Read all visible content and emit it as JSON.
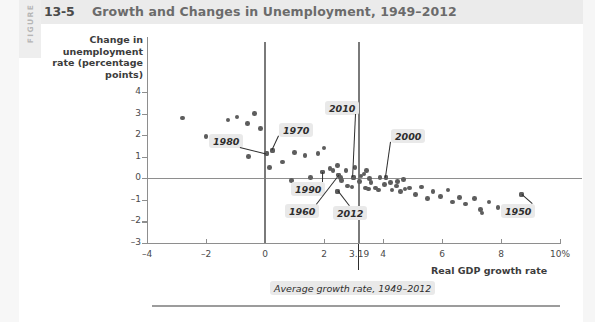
{
  "figure": {
    "kicker": "FIGURE",
    "number": "13-5",
    "title": "Growth and Changes in Unemployment, 1949–2012"
  },
  "chart_data": {
    "type": "scatter",
    "title": "Growth and Changes in Unemployment, 1949–2012",
    "xlabel": "Real GDP growth rate",
    "ylabel": "Change in unemployment rate (percentage points)",
    "xlim": [
      -4,
      10
    ],
    "ylim": [
      -3,
      4
    ],
    "xticks": [
      "-4",
      "-2",
      "0",
      "2",
      "3.19",
      "4",
      "6",
      "8",
      "10%"
    ],
    "xtick_values": [
      -4,
      -2,
      0,
      2,
      3.19,
      4,
      6,
      8,
      10
    ],
    "yticks": [
      "4",
      "3",
      "2",
      "1",
      "0",
      "-1",
      "-2",
      "-3"
    ],
    "ytick_values": [
      4,
      3,
      2,
      1,
      0,
      -1,
      -2,
      -3
    ],
    "grid": false,
    "legend": "none",
    "reference_lines": [
      {
        "axis": "x",
        "value": 0,
        "style": "solid-dark"
      },
      {
        "axis": "x",
        "value": 3.19,
        "style": "solid-dark",
        "note": "Average growth rate, 1949–2012"
      },
      {
        "axis": "y",
        "value": 0,
        "style": "solid-light"
      }
    ],
    "annotations": [
      {
        "label": "1980",
        "x": 0.05,
        "y": 1.15
      },
      {
        "label": "1970",
        "x": 0.25,
        "y": 1.3
      },
      {
        "label": "2010",
        "x": 3.0,
        "y": 0.05
      },
      {
        "label": "2000",
        "x": 4.1,
        "y": 0.05
      },
      {
        "label": "1990",
        "x": 1.95,
        "y": 0.3
      },
      {
        "label": "1960",
        "x": 2.5,
        "y": 0.15
      },
      {
        "label": "2012",
        "x": 2.45,
        "y": -0.6
      },
      {
        "label": "1950",
        "x": 8.7,
        "y": -0.75
      }
    ],
    "points": [
      {
        "x": -2.8,
        "y": 2.8
      },
      {
        "x": -2.0,
        "y": 1.95
      },
      {
        "x": -1.25,
        "y": 2.7
      },
      {
        "x": -0.95,
        "y": 2.85
      },
      {
        "x": -0.6,
        "y": 2.55
      },
      {
        "x": -0.35,
        "y": 3.0
      },
      {
        "x": -0.55,
        "y": 1.0
      },
      {
        "x": -0.15,
        "y": 2.3
      },
      {
        "x": 0.05,
        "y": 1.15
      },
      {
        "x": 0.25,
        "y": 1.3
      },
      {
        "x": 0.6,
        "y": 0.75
      },
      {
        "x": 0.15,
        "y": 0.5
      },
      {
        "x": 1.0,
        "y": 1.2
      },
      {
        "x": 1.35,
        "y": 1.05
      },
      {
        "x": 1.8,
        "y": 1.15
      },
      {
        "x": 2.0,
        "y": 1.4
      },
      {
        "x": 2.2,
        "y": 0.45
      },
      {
        "x": 2.3,
        "y": 0.35
      },
      {
        "x": 1.95,
        "y": 0.3
      },
      {
        "x": 2.45,
        "y": 0.6
      },
      {
        "x": 2.5,
        "y": 0.15
      },
      {
        "x": 2.55,
        "y": 0.05
      },
      {
        "x": 2.6,
        "y": -0.1
      },
      {
        "x": 2.45,
        "y": -0.6
      },
      {
        "x": 2.8,
        "y": -0.35
      },
      {
        "x": 2.95,
        "y": -0.4
      },
      {
        "x": 3.0,
        "y": 0.05
      },
      {
        "x": 3.05,
        "y": 0.5
      },
      {
        "x": 3.2,
        "y": -0.15
      },
      {
        "x": 3.25,
        "y": 0.1
      },
      {
        "x": 3.35,
        "y": 0.2
      },
      {
        "x": 3.4,
        "y": -0.45
      },
      {
        "x": 3.5,
        "y": -0.5
      },
      {
        "x": 3.55,
        "y": 0.0
      },
      {
        "x": 3.6,
        "y": -0.2
      },
      {
        "x": 3.75,
        "y": -0.45
      },
      {
        "x": 3.85,
        "y": -0.55
      },
      {
        "x": 3.9,
        "y": 0.05
      },
      {
        "x": 4.05,
        "y": -0.3
      },
      {
        "x": 4.1,
        "y": 0.05
      },
      {
        "x": 4.25,
        "y": -0.2
      },
      {
        "x": 4.3,
        "y": -0.55
      },
      {
        "x": 4.45,
        "y": -0.35
      },
      {
        "x": 4.5,
        "y": -0.15
      },
      {
        "x": 4.6,
        "y": -0.6
      },
      {
        "x": 4.75,
        "y": -0.5
      },
      {
        "x": 4.9,
        "y": -0.45
      },
      {
        "x": 5.1,
        "y": -0.75
      },
      {
        "x": 5.3,
        "y": -0.4
      },
      {
        "x": 5.5,
        "y": -0.95
      },
      {
        "x": 5.7,
        "y": -0.6
      },
      {
        "x": 5.95,
        "y": -0.85
      },
      {
        "x": 6.2,
        "y": -0.55
      },
      {
        "x": 6.35,
        "y": -1.1
      },
      {
        "x": 6.6,
        "y": -0.9
      },
      {
        "x": 6.8,
        "y": -1.2
      },
      {
        "x": 7.1,
        "y": -0.95
      },
      {
        "x": 7.3,
        "y": -1.45
      },
      {
        "x": 7.35,
        "y": -1.6
      },
      {
        "x": 7.6,
        "y": -1.1
      },
      {
        "x": 7.9,
        "y": -1.35
      },
      {
        "x": 8.25,
        "y": -1.4
      },
      {
        "x": 8.7,
        "y": -0.75
      },
      {
        "x": 1.55,
        "y": 0.05
      },
      {
        "x": 2.75,
        "y": 0.35
      },
      {
        "x": 3.45,
        "y": 0.35
      },
      {
        "x": 4.7,
        "y": -0.05
      },
      {
        "x": 0.9,
        "y": -0.1
      }
    ]
  },
  "callout_box": {
    "text": "Average growth rate, 1949–2012"
  }
}
